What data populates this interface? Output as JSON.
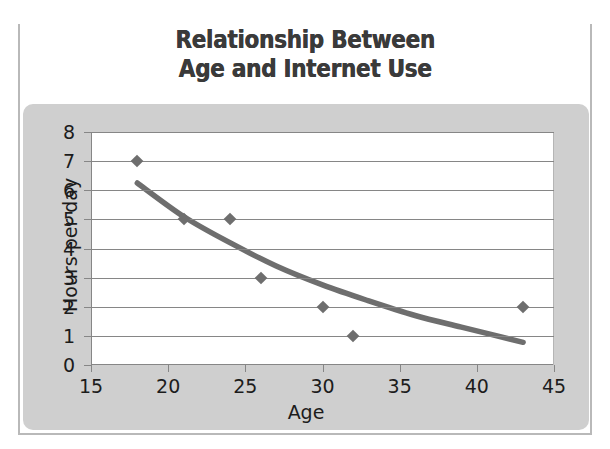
{
  "title": {
    "line1": "Relationship Between",
    "line2": "Age and Internet Use"
  },
  "colors": {
    "panel": "#cfcfcf",
    "plot_background": "#ffffff",
    "gridline": "#868686",
    "marker": "#6e6e6e",
    "trend_line": "#6e6e6e",
    "title_text": "#3a3a3a",
    "axis_text": "#1c1c1c",
    "card_border": "#b9b9b9"
  },
  "chart_data": {
    "type": "scatter",
    "title": "Relationship Between Age and Internet Use",
    "xlabel": "Age",
    "ylabel": "Hours per day",
    "xlim": [
      15,
      45
    ],
    "ylim": [
      0,
      8
    ],
    "xticks": [
      15,
      20,
      25,
      30,
      35,
      40,
      45
    ],
    "yticks": [
      0,
      1,
      2,
      3,
      4,
      5,
      6,
      7,
      8
    ],
    "grid": "horizontal",
    "legend": "none",
    "marker_style": "diamond",
    "points": [
      {
        "x": 18,
        "y": 7
      },
      {
        "x": 21,
        "y": 5
      },
      {
        "x": 24,
        "y": 5
      },
      {
        "x": 26,
        "y": 3
      },
      {
        "x": 30,
        "y": 2
      },
      {
        "x": 32,
        "y": 1
      },
      {
        "x": 43,
        "y": 2
      }
    ],
    "trend_line": {
      "style": "smooth-curve-decreasing",
      "points": [
        {
          "x": 18,
          "y": 6.25
        },
        {
          "x": 21,
          "y": 5.1
        },
        {
          "x": 24,
          "y": 4.2
        },
        {
          "x": 27,
          "y": 3.4
        },
        {
          "x": 30,
          "y": 2.75
        },
        {
          "x": 33,
          "y": 2.2
        },
        {
          "x": 36,
          "y": 1.7
        },
        {
          "x": 39,
          "y": 1.3
        },
        {
          "x": 43,
          "y": 0.78
        }
      ]
    }
  }
}
